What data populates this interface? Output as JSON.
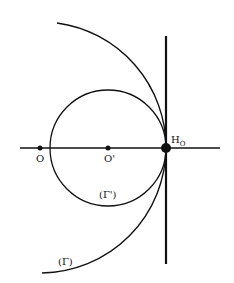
{
  "diagram": {
    "points": {
      "O": {
        "label": "O"
      },
      "O_prime": {
        "label": "O'"
      },
      "H": {
        "label": "H",
        "subscript": "O"
      }
    },
    "curves": {
      "gamma": {
        "label": "(Γ)"
      },
      "gamma_prime": {
        "label": "(Γ')"
      }
    },
    "colors": {
      "stroke": "#111111",
      "background": "#ffffff"
    }
  }
}
